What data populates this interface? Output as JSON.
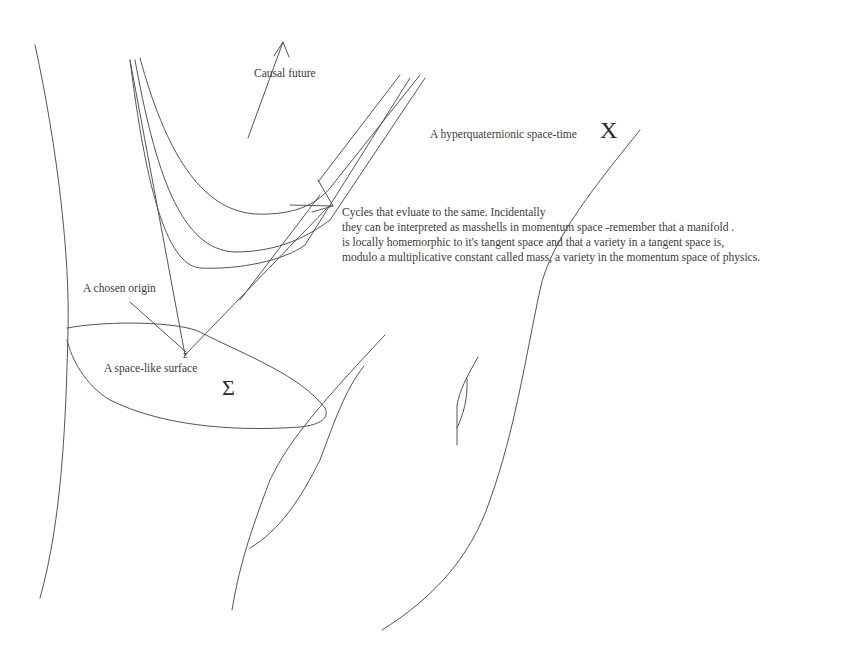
{
  "diagram": {
    "labels": {
      "causal_future": "Causal future",
      "spacetime": "A hyperquaternionic space-time",
      "spacetime_symbol": "X",
      "chosen_origin": "A chosen origin",
      "origin_mark": "z",
      "spacelike_surface": "A space-like surface",
      "surface_symbol": "Σ"
    },
    "note": {
      "lines": [
        "Cycles that evluate to the same. Incidentally",
        "they can be interpreted as masshells in momentum space -remember that a manifold .",
        "is locally homemorphic to it's tangent space and that a variety in a tangent space is,",
        "modulo a multiplicative constant called mass, a variety in the momentum space of physics."
      ]
    },
    "colors": {
      "background": "#ffffff",
      "stroke": "#555555",
      "text": "#3a3a3a"
    }
  }
}
